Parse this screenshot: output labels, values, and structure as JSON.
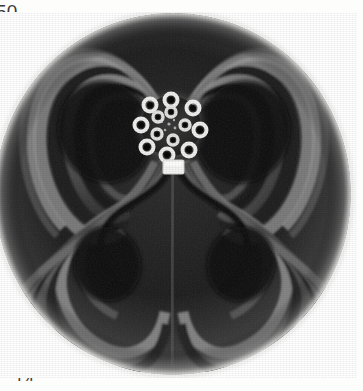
{
  "page": {
    "background_color": "#fdfdfc",
    "width": 363,
    "height": 391
  },
  "margins": {
    "top_left_label": "50",
    "left_line_1": "n",
    "left_line_2": "d",
    "left_line_3": "ed",
    "bottom_label": "14"
  },
  "figure": {
    "name": "specimen-cross-section-micrograph",
    "type": "grayscale-micrograph",
    "shape": "circular-disk",
    "symmetry": "four-lobed-clover",
    "colors": {
      "background": "#ffffff",
      "disk_rim": "#b9b9b9",
      "band_light": "#9a9a9a",
      "band_mid": "#5e5e5e",
      "band_dark": "#1a1a1a",
      "void": "#0a0a0a",
      "highlight": "#f2f2f0"
    },
    "center": {
      "x": 170,
      "y": 113
    },
    "radius": 178,
    "lobes": [
      {
        "name": "upper-left-lobe",
        "angle_deg": 135
      },
      {
        "name": "upper-right-lobe",
        "angle_deg": 45
      },
      {
        "name": "lower-left-lobe",
        "angle_deg": 215
      },
      {
        "name": "lower-right-lobe",
        "angle_deg": 325
      }
    ],
    "core": {
      "name": "central-annuli-cluster",
      "description": "bright cluster of ring-shaped annuli",
      "ring_count": 17,
      "cx": 170,
      "cy": 113,
      "radius": 36
    },
    "marker": {
      "name": "bright-rectangular-marker",
      "cx": 180,
      "cy": 153,
      "width": 20,
      "height": 13
    }
  }
}
